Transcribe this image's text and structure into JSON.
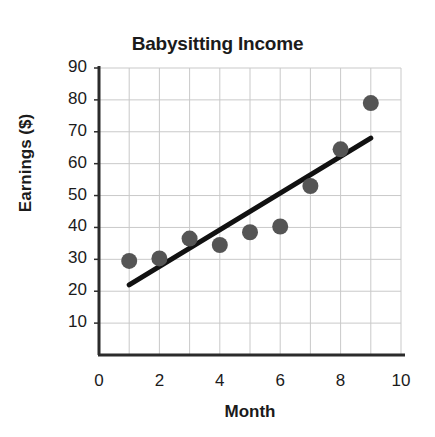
{
  "chart_data": {
    "type": "scatter",
    "title": "Babysitting Income",
    "xlabel": "Month",
    "ylabel": "Earnings ($)",
    "xlim": [
      0,
      10
    ],
    "ylim": [
      0,
      90
    ],
    "xticks": [
      0,
      2,
      4,
      6,
      8,
      10
    ],
    "xtick_labels": [
      "0",
      "2",
      "4",
      "6",
      "8",
      "10"
    ],
    "yticks": [
      10,
      20,
      30,
      40,
      50,
      60,
      70,
      80,
      90
    ],
    "ytick_labels": [
      "10",
      "20",
      "30",
      "40",
      "50",
      "60",
      "70",
      "80",
      "90"
    ],
    "grid": true,
    "grid_x_step": 1,
    "grid_y_step": 10,
    "legend": "none",
    "series": [
      {
        "name": "Monthly earnings",
        "type": "scatter",
        "marker": "circle",
        "color": "#555555",
        "x": [
          1,
          2,
          3,
          4,
          5,
          6,
          7,
          8,
          9
        ],
        "values": [
          29.5,
          30.3,
          36.5,
          34.5,
          38.5,
          40.3,
          53.0,
          64.5,
          79.0
        ]
      },
      {
        "name": "Trend line",
        "type": "line",
        "color": "#111111",
        "x": [
          1,
          9
        ],
        "values": [
          22.0,
          68.0
        ]
      }
    ]
  },
  "style": {
    "marker_color": "#555555",
    "line_color": "#111111",
    "axis_color": "#2b2b2b",
    "grid_color": "#c9c9c9",
    "text_color": "#1b1b1b",
    "background": "#ffffff",
    "marker_radius": 8,
    "line_width": 5
  }
}
